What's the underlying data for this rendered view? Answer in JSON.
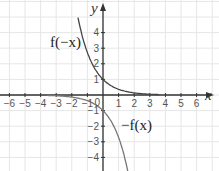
{
  "chart_data": {
    "type": "line",
    "title": "",
    "xlabel": "x",
    "ylabel": "y",
    "xlim": [
      -6.5,
      7
    ],
    "ylim": [
      -4.5,
      5.5
    ],
    "grid": true,
    "x_ticks": [
      -6,
      -5,
      -4,
      -3,
      -2,
      -1,
      0,
      1,
      2,
      3,
      4,
      5,
      6
    ],
    "y_ticks": [
      -4,
      -3,
      -2,
      -1,
      1,
      2,
      3,
      4
    ],
    "origin_label": "0",
    "series": [
      {
        "name": "f(-x)",
        "label": "f(−x)",
        "color": "#444444",
        "x": [
          -1.4,
          -1.2,
          -1,
          -0.8,
          -0.6,
          -0.4,
          -0.2,
          0,
          0.5,
          1,
          1.5,
          2,
          2.5,
          3,
          3.5
        ],
        "y": [
          4.06,
          3.32,
          2.72,
          2.23,
          1.82,
          1.49,
          1.22,
          1,
          0.61,
          0.37,
          0.22,
          0.14,
          0.08,
          0.05,
          0.03
        ]
      },
      {
        "name": "-f(x)",
        "label": "−f(x)",
        "color": "#777777",
        "x": [
          -3.5,
          -3,
          -2.5,
          -2,
          -1.5,
          -1,
          -0.5,
          0,
          0.2,
          0.4,
          0.6,
          0.8,
          1,
          1.2,
          1.4
        ],
        "y": [
          -0.03,
          -0.05,
          -0.08,
          -0.14,
          -0.22,
          -0.37,
          -0.61,
          -1,
          -1.22,
          -1.49,
          -1.82,
          -2.23,
          -2.72,
          -3.32,
          -4.06
        ]
      }
    ],
    "annotations": [
      {
        "text": "f(−x)",
        "x": -4,
        "y": 3
      },
      {
        "text": "−f(x)",
        "x": 2.3,
        "y": -1.9
      }
    ]
  },
  "labels": {
    "x_axis": "x",
    "y_axis": "y",
    "origin": "0",
    "curve_a": "f(−x)",
    "curve_b": "−f(x)"
  }
}
